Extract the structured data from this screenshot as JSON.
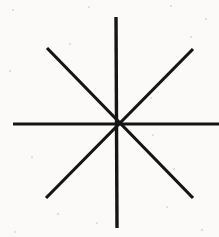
{
  "figure": {
    "medium": "scanned line drawing",
    "canvas": {
      "width": 219,
      "height": 237,
      "background_color": "#fbfaf8",
      "noise_color": "#d9d6d1"
    },
    "stroke": {
      "color": "#151515",
      "width": 3,
      "linecap": "butt"
    },
    "center": {
      "label": "center",
      "x": 117,
      "y": 124
    },
    "ray_count": 8,
    "line_count": 4,
    "lines": [
      {
        "name": "vertical-line",
        "orientation": "vertical",
        "angle_deg": 90,
        "x1": 116,
        "y1": 17,
        "x2": 117,
        "y2": 228,
        "stroke_width": 3.4
      },
      {
        "name": "horizontal-line",
        "orientation": "horizontal",
        "angle_deg": 0,
        "x1": 13,
        "y1": 124,
        "x2": 219,
        "y2": 124,
        "stroke_width": 3.2
      },
      {
        "name": "diagonal-nw-se-line",
        "orientation": "diagonal-nw-se",
        "angle_deg": -45,
        "x1": 47,
        "y1": 48,
        "x2": 193,
        "y2": 198,
        "stroke_width": 3.2
      },
      {
        "name": "diagonal-ne-sw-line",
        "orientation": "diagonal-ne-sw",
        "angle_deg": 45,
        "x1": 193,
        "y1": 49,
        "x2": 46,
        "y2": 198,
        "stroke_width": 3.2
      }
    ],
    "ray_endpoints": [
      {
        "name": "ray-north",
        "direction": "N",
        "x": 116,
        "y": 17
      },
      {
        "name": "ray-northeast",
        "direction": "NE",
        "x": 193,
        "y": 49
      },
      {
        "name": "ray-east",
        "direction": "E",
        "x": 219,
        "y": 124
      },
      {
        "name": "ray-southeast",
        "direction": "SE",
        "x": 193,
        "y": 198
      },
      {
        "name": "ray-south",
        "direction": "S",
        "x": 117,
        "y": 228
      },
      {
        "name": "ray-southwest",
        "direction": "SW",
        "x": 46,
        "y": 198
      },
      {
        "name": "ray-west",
        "direction": "W",
        "x": 13,
        "y": 124
      },
      {
        "name": "ray-northwest",
        "direction": "NW",
        "x": 47,
        "y": 48
      }
    ],
    "specks": [
      {
        "x": 12,
        "y": 9,
        "size": 2
      },
      {
        "x": 88,
        "y": 6,
        "size": 2
      },
      {
        "x": 170,
        "y": 5,
        "size": 2
      },
      {
        "x": 205,
        "y": 18,
        "size": 2
      },
      {
        "x": 69,
        "y": 43,
        "size": 2
      },
      {
        "x": 190,
        "y": 36,
        "size": 2
      },
      {
        "x": 9,
        "y": 70,
        "size": 2
      },
      {
        "x": 150,
        "y": 97,
        "size": 2
      },
      {
        "x": 152,
        "y": 134,
        "size": 2
      },
      {
        "x": 31,
        "y": 156,
        "size": 2
      },
      {
        "x": 173,
        "y": 168,
        "size": 2
      },
      {
        "x": 57,
        "y": 213,
        "size": 2
      },
      {
        "x": 96,
        "y": 222,
        "size": 2
      },
      {
        "x": 166,
        "y": 206,
        "size": 2
      },
      {
        "x": 201,
        "y": 229,
        "size": 2
      },
      {
        "x": 14,
        "y": 231,
        "size": 2
      }
    ]
  }
}
